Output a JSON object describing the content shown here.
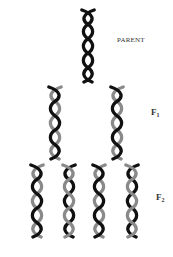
{
  "diagram": {
    "labels": {
      "parent": "PARENT",
      "f1_letter": "F",
      "f1_sub": "1",
      "f2_letter": "F",
      "f2_sub": "2"
    },
    "colors": {
      "parent_strand": "#111111",
      "new_strand": "#8a8a8a",
      "background": "#ffffff"
    },
    "generations": [
      {
        "name": "Parent",
        "helix_count": 1,
        "strands": [
          "old",
          "old"
        ]
      },
      {
        "name": "F1",
        "helix_count": 2,
        "strands": [
          "old",
          "new"
        ]
      },
      {
        "name": "F2",
        "helix_count": 4,
        "strands": [
          "mixed"
        ]
      }
    ]
  }
}
